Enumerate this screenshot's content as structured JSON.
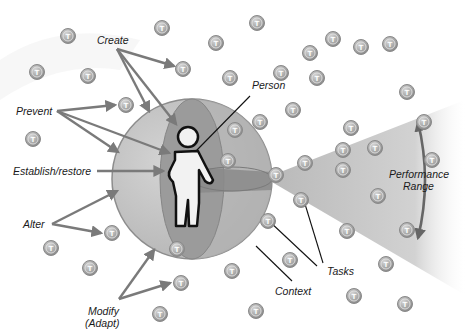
{
  "diagram": {
    "type": "conceptual",
    "colors": {
      "background": "#ffffff",
      "sphere_light": "#c9c9c9",
      "sphere_mid": "#a9a9a9",
      "sphere_dark": "#8f8f8f",
      "arrow": "#7a7a7a",
      "leader_line": "#111111",
      "task_fill": "#a8a8a8",
      "task_stroke": "#8a8a8a",
      "wedge": "#bdbdbd",
      "person_fill": "#f2f2f2",
      "person_outline": "#111111"
    },
    "labels": {
      "create": "Create",
      "prevent": "Prevent",
      "establish_restore": "Establish/restore",
      "alter": "Alter",
      "modify_line1": "Modify",
      "modify_line2": "(Adapt)",
      "person": "Person",
      "performance_line1": "Performance",
      "performance_line2": "Range",
      "tasks": "Tasks",
      "context": "Context"
    },
    "task_symbol": "T",
    "tasks": [
      {
        "x": 68,
        "y": 36
      },
      {
        "x": 162,
        "y": 28
      },
      {
        "x": 216,
        "y": 43
      },
      {
        "x": 257,
        "y": 23
      },
      {
        "x": 333,
        "y": 39
      },
      {
        "x": 390,
        "y": 44
      },
      {
        "x": 37,
        "y": 72
      },
      {
        "x": 88,
        "y": 76
      },
      {
        "x": 183,
        "y": 69
      },
      {
        "x": 230,
        "y": 78
      },
      {
        "x": 281,
        "y": 73
      },
      {
        "x": 310,
        "y": 53
      },
      {
        "x": 361,
        "y": 47
      },
      {
        "x": 126,
        "y": 105
      },
      {
        "x": 33,
        "y": 139
      },
      {
        "x": 317,
        "y": 78
      },
      {
        "x": 407,
        "y": 92
      },
      {
        "x": 293,
        "y": 110
      },
      {
        "x": 351,
        "y": 128
      },
      {
        "x": 424,
        "y": 122
      },
      {
        "x": 260,
        "y": 122
      },
      {
        "x": 375,
        "y": 148
      },
      {
        "x": 343,
        "y": 150
      },
      {
        "x": 432,
        "y": 160
      },
      {
        "x": 305,
        "y": 163
      },
      {
        "x": 268,
        "y": 221
      },
      {
        "x": 378,
        "y": 196
      },
      {
        "x": 301,
        "y": 200
      },
      {
        "x": 343,
        "y": 170
      },
      {
        "x": 407,
        "y": 230
      },
      {
        "x": 276,
        "y": 175
      },
      {
        "x": 347,
        "y": 231
      },
      {
        "x": 386,
        "y": 264
      },
      {
        "x": 112,
        "y": 233
      },
      {
        "x": 51,
        "y": 248
      },
      {
        "x": 90,
        "y": 268
      },
      {
        "x": 177,
        "y": 249
      },
      {
        "x": 181,
        "y": 283
      },
      {
        "x": 232,
        "y": 271
      },
      {
        "x": 290,
        "y": 260
      },
      {
        "x": 354,
        "y": 296
      },
      {
        "x": 405,
        "y": 304
      },
      {
        "x": 256,
        "y": 311
      },
      {
        "x": 160,
        "y": 314
      },
      {
        "x": 228,
        "y": 161
      },
      {
        "x": 235,
        "y": 130
      }
    ]
  }
}
